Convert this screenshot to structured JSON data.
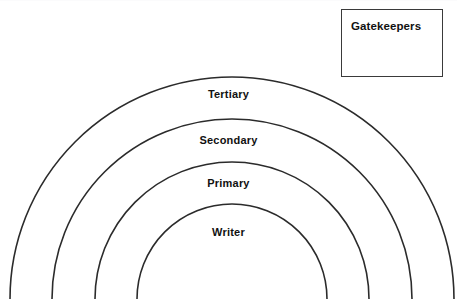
{
  "canvas": {
    "width": 457,
    "height": 299,
    "background": "#ffffff"
  },
  "diagram": {
    "type": "concentric-arc-hierarchy",
    "title_text": "",
    "center_x": 232,
    "center_y": 300,
    "stroke_color": "#2b2b2b",
    "stroke_width": 1.6,
    "rings": [
      {
        "id": "ring-tertiary",
        "label": "Tertiary",
        "radius": 222,
        "label_y": 88,
        "order": 4
      },
      {
        "id": "ring-secondary",
        "label": "Secondary",
        "radius": 180,
        "label_y": 134,
        "order": 3
      },
      {
        "id": "ring-primary",
        "label": "Primary",
        "radius": 137,
        "label_y": 177,
        "order": 2
      },
      {
        "id": "ring-writer",
        "label": "Writer",
        "radius": 95,
        "label_y": 226,
        "order": 1
      }
    ]
  },
  "gatekeepers": {
    "label": "Gatekeepers",
    "border_color": "#3a3a3a",
    "background": "#ffffff",
    "x": 341,
    "y": 9,
    "width": 102,
    "height": 68
  }
}
